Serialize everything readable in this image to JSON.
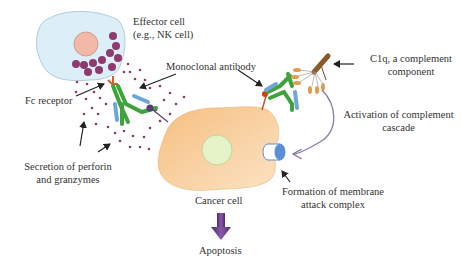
{
  "diagram": {
    "labels": {
      "effector_cell_line1": "Effector cell",
      "effector_cell_line2": "(e.g., NK cell)",
      "monoclonal_antibody": "Monoclonal antibody",
      "c1q_line1": "C1q, a complement",
      "c1q_line2": "component",
      "fc_receptor": "Fc receptor",
      "activation_line1": "Activation of complement",
      "activation_line2": "cascade",
      "secretion_line1": "Secretion of perforin",
      "secretion_line2": "and granzymes",
      "cancer_cell": "Cancer cell",
      "mac_line1": "Formation of membrane",
      "mac_line2": "attack complex",
      "apoptosis": "Apoptosis"
    },
    "nodes": [
      {
        "id": "effector-cell",
        "label": "Effector cell (e.g., NK cell)",
        "shape": "blob",
        "color": "#d7ecf7"
      },
      {
        "id": "cancer-cell",
        "label": "Cancer cell",
        "shape": "blob",
        "color": "#f7c98f"
      },
      {
        "id": "monoclonal-antibody-adcc",
        "label": "Monoclonal antibody",
        "shape": "Y-antibody",
        "color": "#3aa335"
      },
      {
        "id": "monoclonal-antibody-cdc",
        "label": "Monoclonal antibody",
        "shape": "Y-antibody",
        "color": "#3aa335"
      },
      {
        "id": "c1q",
        "label": "C1q, a complement component",
        "shape": "bouquet",
        "color": "#8b5a2b"
      },
      {
        "id": "mac",
        "label": "Formation of membrane attack complex",
        "shape": "cylinder",
        "color": "#5b8fd6"
      },
      {
        "id": "apoptosis",
        "label": "Apoptosis",
        "shape": "text"
      }
    ],
    "edges": [
      {
        "from": "effector-cell",
        "to": "monoclonal-antibody-adcc",
        "label": "Fc receptor"
      },
      {
        "from": "effector-cell",
        "to": "cancer-cell",
        "label": "Secretion of perforin and granzymes"
      },
      {
        "from": "c1q",
        "to": "mac",
        "label": "Activation of complement cascade"
      },
      {
        "from": "cancer-cell",
        "to": "apoptosis",
        "label": ""
      }
    ],
    "colors": {
      "effector_fill": "#dceef8",
      "effector_nucleus": "#f2b8a8",
      "granule": "#8e3a6e",
      "cancer_fill": "#f8cf9a",
      "cancer_nucleus": "#e6f2c8",
      "antibody_heavy": "#3ea33a",
      "antibody_light": "#6fa6d8",
      "fc_receptor": "#e05a2a",
      "c1q_stem": "#8b5a2b",
      "c1q_head": "#e29a4c",
      "mac": "#5b8fd6",
      "activation_arrow": "#8e7aa8",
      "apoptosis_arrow": "#6a3d8a",
      "text": "#333333"
    }
  }
}
